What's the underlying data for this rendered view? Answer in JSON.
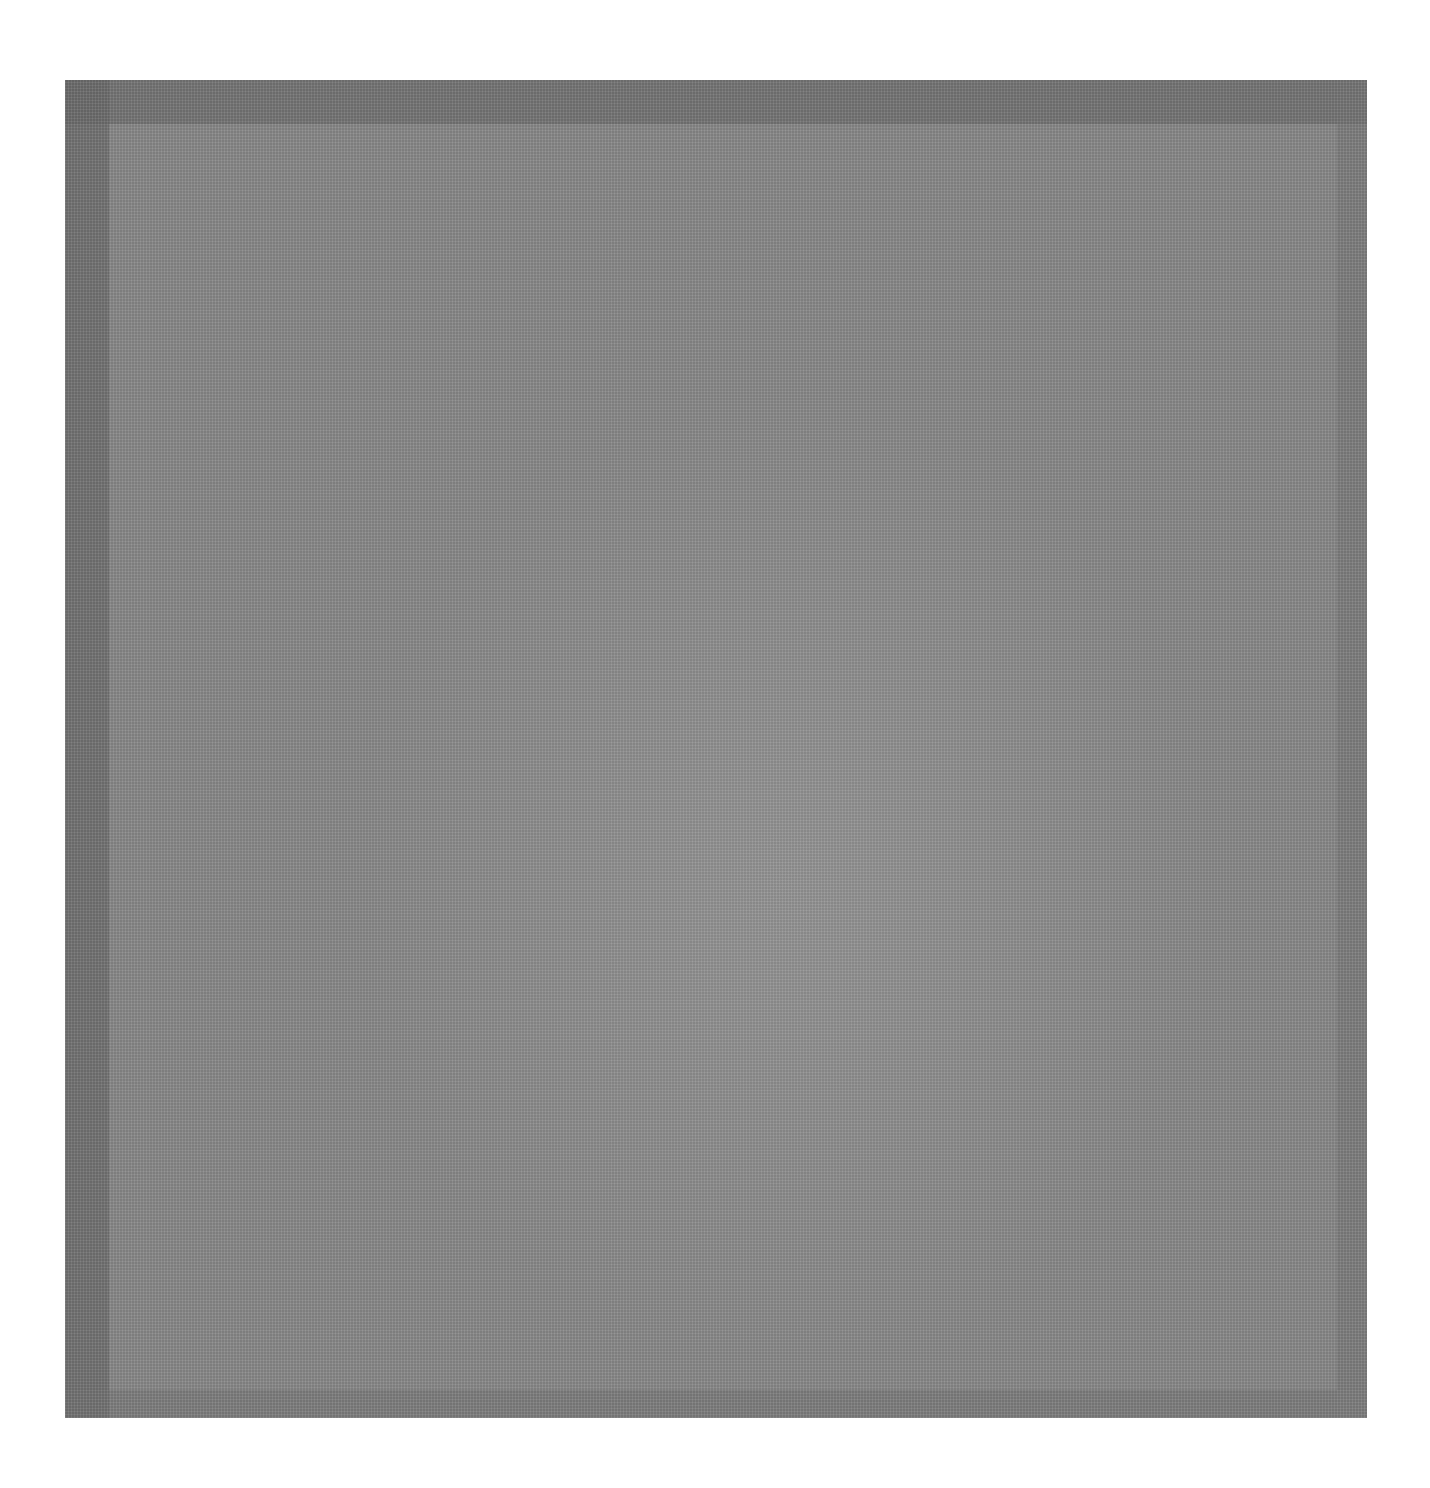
{
  "image": {
    "subject": "gray-fabric-swatch",
    "colors": {
      "background": "#ffffff",
      "swatch_main": "#8a8a8a",
      "swatch_border": "#767676",
      "swatch_highlight": "#a0a0a0"
    }
  }
}
